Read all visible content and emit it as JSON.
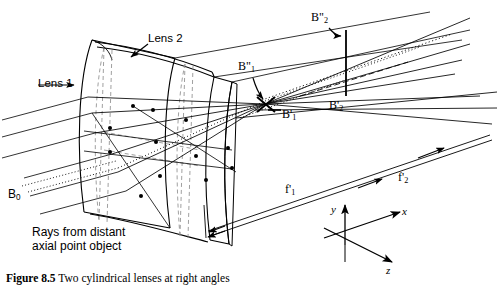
{
  "figure": {
    "caption_prefix": "Figure 8.5",
    "caption_text": "Two cylindrical lenses at right angles",
    "background_color": "#ffffff",
    "ink_color": "#000000"
  },
  "labels": {
    "lens1": "Lens 1",
    "lens2": "Lens 2",
    "b0": "B",
    "b0_sub": "0",
    "b_double_prime_1_base": "B",
    "b_double_prime_1_marks": "\"",
    "b_double_prime_1_sub": "1",
    "b_prime_1_base": "B",
    "b_prime_1_marks": "'",
    "b_prime_1_sub": "1",
    "b_double_prime_2_base": "B",
    "b_double_prime_2_marks": "\"",
    "b_double_prime_2_sub": "2",
    "b_prime_2_base": "B",
    "b_prime_2_marks": "'",
    "b_prime_2_sub": "2",
    "f_prime_1_base": "f",
    "f_prime_1_marks": "'",
    "f_prime_1_sub": "1",
    "f_prime_2_base": "f",
    "f_prime_2_marks": "'",
    "f_prime_2_sub": "2",
    "rays_line1": "Rays from distant",
    "rays_line2": "axial point object"
  },
  "axes": {
    "x_label": "x",
    "y_label": "y",
    "z_label": "z"
  }
}
